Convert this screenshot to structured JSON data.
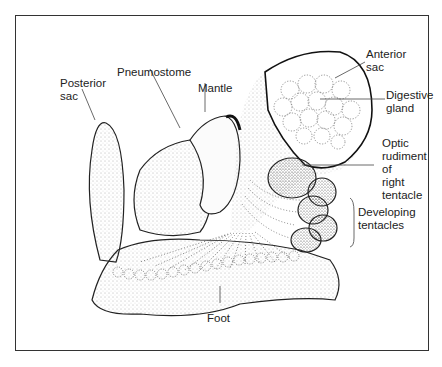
{
  "figure": {
    "type": "anatomical illustration",
    "labels": {
      "anterior_sac": [
        "Anterior",
        "sac"
      ],
      "digestive_gland": [
        "Digestive",
        "gland"
      ],
      "optic_rudiment": [
        "Optic",
        "rudiment",
        "of",
        "right",
        "tentacle"
      ],
      "developing_tentacles": [
        "Developing",
        "tentacles"
      ],
      "posterior_sac": [
        "Posterior",
        "sac"
      ],
      "pneumostome": [
        "Pneumostome"
      ],
      "mantle": [
        "Mantle"
      ],
      "foot": [
        "Foot"
      ]
    },
    "colors": {
      "line": "#222222",
      "stipple": "#555555",
      "background": "#ffffff"
    }
  }
}
